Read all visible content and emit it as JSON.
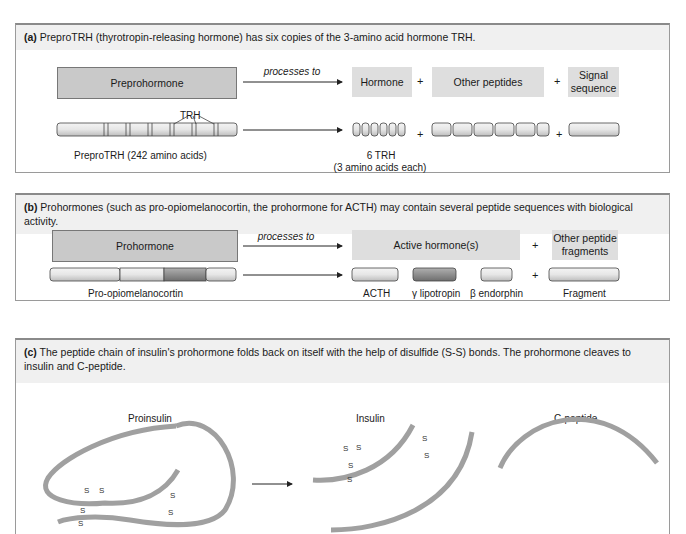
{
  "panel_a": {
    "letter": "(a)",
    "caption": "PreproTRH (thyrotropin-releasing hormone) has six copies of the 3-amino acid hormone TRH.",
    "preprohormone_label": "Preprohormone",
    "processes_to": "processes to",
    "hormone_label": "Hormone",
    "other_peptides_label": "Other peptides",
    "signal_sequence_label": "Signal sequence",
    "trh_label": "TRH",
    "prepro_trh_label": "PreproTRH (242 amino acids)",
    "six_trh_label": "6 TRH",
    "six_trh_sub": "(3 amino acids each)",
    "plus": "+"
  },
  "panel_b": {
    "letter": "(b)",
    "caption": "Prohormones (such as pro-opiomelanocortin, the prohormone for ACTH) may contain several peptide sequences with biological activity.",
    "prohormone_label": "Prohormone",
    "processes_to": "processes to",
    "active_hormone_label": "Active hormone(s)",
    "other_fragments_label": "Other peptide fragments",
    "pomc_label": "Pro-opiomelanocortin",
    "acth_label": "ACTH",
    "gamma_label": "γ lipotropin",
    "beta_label": "β endorphin",
    "fragment_label": "Fragment",
    "plus": "+"
  },
  "panel_c": {
    "letter": "(c)",
    "caption": "The peptide chain of insulin's prohormone folds back on itself with the help of disulfide (S-S) bonds. The prohormone cleaves to insulin and C-peptide.",
    "proinsulin_label": "Proinsulin",
    "insulin_label": "Insulin",
    "cpeptide_label": "C-peptide",
    "s": "S"
  },
  "colors": {
    "box_fill": "#c9c9c9",
    "light_box_fill": "#dedede",
    "chain": "#9e9e9e",
    "panel_head_bg": "#f0f0f0"
  }
}
